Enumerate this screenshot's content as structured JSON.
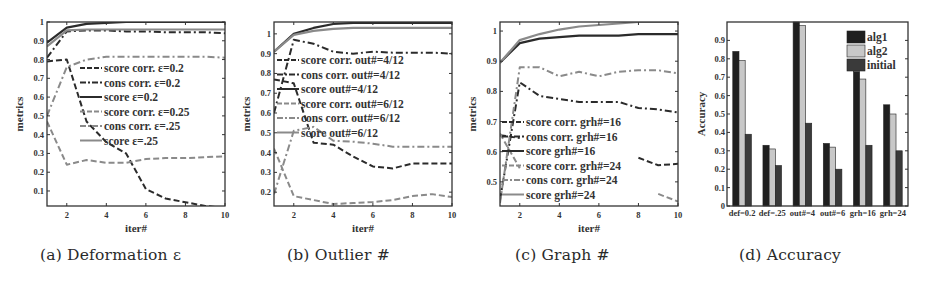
{
  "figure": {
    "captions": {
      "a": "(a)  Deformation ε",
      "b": "(b)  Outlier #",
      "c": "(c)  Graph #",
      "d": "(d)  Accuracy"
    }
  },
  "colors": {
    "line_dark": "#2b2b2b",
    "line_mid": "#555555",
    "line_light": "#8a8a8a",
    "bar_alg1": "#1f1f1f",
    "bar_alg2": "#c8c8c8",
    "bar_initial": "#3a3a3a",
    "frame": "#333333"
  },
  "chart_data": [
    {
      "id": "a",
      "type": "line",
      "title": "Deformation ε",
      "xlabel": "iter#",
      "ylabel": "metrics",
      "xlim": [
        1,
        10
      ],
      "ylim": [
        0.02,
        1.0
      ],
      "xticks": [
        2,
        4,
        6,
        8,
        10
      ],
      "yticks": [
        0.1,
        0.2,
        0.3,
        0.4,
        0.5,
        0.6,
        0.7,
        0.8,
        0.9,
        1
      ],
      "ytick_labels": [
        "0.1",
        "0.2",
        "0.3",
        "0.4",
        "0.5",
        "0.6",
        "0.7",
        "0.8",
        "0.9",
        "1"
      ],
      "legend_position": "center-right",
      "x": [
        1,
        2,
        3,
        4,
        5,
        6,
        7,
        8,
        9,
        10
      ],
      "series": [
        {
          "name": "score corr. ε=0.2",
          "style": "dashed",
          "shade": "dark",
          "values": [
            0.79,
            0.8,
            0.47,
            0.36,
            0.3,
            0.11,
            0.06,
            0.04,
            0.02,
            0.01
          ]
        },
        {
          "name": "cons corr. ε=0.2",
          "style": "dashdot",
          "shade": "dark",
          "values": [
            0.81,
            0.95,
            0.955,
            0.955,
            0.95,
            0.95,
            0.945,
            0.945,
            0.945,
            0.94
          ]
        },
        {
          "name": "score ε=0.2",
          "style": "solid",
          "shade": "dark",
          "values": [
            0.89,
            0.97,
            0.99,
            0.995,
            1.0,
            1.0,
            1.0,
            1.0,
            1.0,
            1.0
          ]
        },
        {
          "name": "score corr. ε=0.25",
          "style": "dashed",
          "shade": "light",
          "values": [
            0.47,
            0.24,
            0.265,
            0.25,
            0.25,
            0.27,
            0.275,
            0.275,
            0.28,
            0.285
          ]
        },
        {
          "name": "cons corr. ε=.25",
          "style": "dashdot",
          "shade": "light",
          "values": [
            0.5,
            0.76,
            0.8,
            0.815,
            0.815,
            0.815,
            0.815,
            0.815,
            0.815,
            0.81
          ]
        },
        {
          "name": "score ε=.25",
          "style": "solid",
          "shade": "light",
          "values": [
            0.87,
            0.955,
            0.96,
            0.96,
            0.96,
            0.96,
            0.96,
            0.96,
            0.96,
            0.96
          ]
        }
      ]
    },
    {
      "id": "b",
      "type": "line",
      "title": "Outlier #",
      "xlabel": "iter#",
      "ylabel": "metrics",
      "xlim": [
        1,
        10
      ],
      "ylim": [
        0.13,
        1.06
      ],
      "xticks": [
        2,
        4,
        6,
        8,
        10
      ],
      "yticks": [
        0.2,
        0.3,
        0.4,
        0.5,
        0.6,
        0.7,
        0.8,
        0.9,
        1
      ],
      "ytick_labels": [
        "0.2",
        "0.3",
        "0.4",
        "0.5",
        "0.6",
        "0.7",
        "0.8",
        "0.9",
        "1"
      ],
      "legend_position": "center-right",
      "x": [
        1,
        2,
        3,
        4,
        5,
        6,
        7,
        8,
        9,
        10
      ],
      "series": [
        {
          "name": "score corr. out#=4/12",
          "style": "dashed",
          "shade": "dark",
          "values": [
            0.77,
            0.75,
            0.45,
            0.44,
            0.38,
            0.33,
            0.32,
            0.345,
            0.345,
            0.345
          ]
        },
        {
          "name": "cons corr. out#=4/12",
          "style": "dashdot",
          "shade": "dark",
          "values": [
            0.6,
            0.97,
            0.95,
            0.91,
            0.9,
            0.91,
            0.905,
            0.905,
            0.905,
            0.9
          ]
        },
        {
          "name": "score out#=4/12",
          "style": "solid",
          "shade": "dark",
          "values": [
            0.91,
            1.0,
            1.03,
            1.05,
            1.055,
            1.055,
            1.055,
            1.055,
            1.055,
            1.055
          ]
        },
        {
          "name": "score corr. out#=6/12",
          "style": "dashed",
          "shade": "light",
          "values": [
            0.42,
            0.18,
            0.16,
            0.14,
            0.145,
            0.15,
            0.16,
            0.18,
            0.19,
            0.175
          ]
        },
        {
          "name": "cons corr. out#=6/12",
          "style": "dashdot",
          "shade": "light",
          "values": [
            0.19,
            0.51,
            0.53,
            0.46,
            0.455,
            0.445,
            0.43,
            0.43,
            0.43,
            0.43
          ]
        },
        {
          "name": "score out#=6/12",
          "style": "solid",
          "shade": "light",
          "values": [
            0.91,
            0.995,
            1.015,
            1.025,
            1.03,
            1.03,
            1.03,
            1.03,
            1.03,
            1.03
          ]
        }
      ]
    },
    {
      "id": "c",
      "type": "line",
      "title": "Graph #",
      "xlabel": "iter#",
      "ylabel": "metrics",
      "xlim": [
        1,
        10
      ],
      "ylim": [
        0.42,
        1.03
      ],
      "xticks": [
        2,
        4,
        6,
        8,
        10
      ],
      "yticks": [
        0.5,
        0.6,
        0.7,
        0.8,
        0.9,
        1
      ],
      "ytick_labels": [
        "0.5",
        "0.6",
        "0.7",
        "0.8",
        "0.9",
        "1"
      ],
      "legend_position": "lower-left",
      "x": [
        1,
        2,
        3,
        4,
        5,
        6,
        7,
        8,
        9,
        10
      ],
      "series": [
        {
          "name": "score corr. grh#=16",
          "style": "dashed",
          "shade": "dark",
          "values": [
            0.655,
            0.645,
            null,
            null,
            null,
            null,
            null,
            0.58,
            0.555,
            0.56
          ]
        },
        {
          "name": "cons corr. grh#=16",
          "style": "dashdot",
          "shade": "dark",
          "values": [
            0.44,
            0.83,
            0.785,
            0.775,
            0.765,
            0.765,
            0.765,
            0.745,
            0.74,
            0.73
          ]
        },
        {
          "name": "score grh#=16",
          "style": "solid",
          "shade": "dark",
          "values": [
            0.895,
            0.96,
            0.975,
            0.98,
            0.985,
            0.985,
            0.985,
            0.99,
            0.99,
            0.99
          ]
        },
        {
          "name": "score corr. grh#=24",
          "style": "dashed",
          "shade": "light",
          "values": [
            0.66,
            0.545,
            null,
            null,
            null,
            null,
            null,
            null,
            0.46,
            0.435
          ]
        },
        {
          "name": "cons corr. grh#=24",
          "style": "dashdot",
          "shade": "light",
          "values": [
            0.43,
            0.88,
            0.88,
            0.85,
            0.865,
            0.85,
            0.865,
            0.87,
            0.87,
            0.86
          ]
        },
        {
          "name": "score grh#=24",
          "style": "solid",
          "shade": "light",
          "values": [
            0.895,
            0.97,
            0.99,
            1.005,
            1.015,
            1.02,
            1.025,
            1.03,
            1.03,
            1.03
          ]
        }
      ]
    },
    {
      "id": "d",
      "type": "bar",
      "title": "Accuracy",
      "xlabel": "",
      "ylabel": "Accuracy",
      "ylim": [
        0,
        1.0
      ],
      "yticks": [
        0,
        0.1,
        0.2,
        0.3,
        0.4,
        0.5,
        0.6,
        0.7,
        0.8,
        0.9
      ],
      "ytick_labels": [
        "0",
        "0.1",
        "0.2",
        "0.3",
        "0.4",
        "0.5",
        "0.6",
        "0.7",
        "0.8",
        "0.9"
      ],
      "legend_position": "upper-right",
      "categories": [
        "def=0.2",
        "def=.25",
        "out#=4",
        "out#=6",
        "grh=16",
        "grh=24"
      ],
      "series": [
        {
          "name": "alg1",
          "values": [
            0.84,
            0.33,
            1.0,
            0.34,
            0.73,
            0.55
          ]
        },
        {
          "name": "alg2",
          "values": [
            0.79,
            0.31,
            0.98,
            0.32,
            0.69,
            0.5
          ]
        },
        {
          "name": "initial",
          "values": [
            0.39,
            0.22,
            0.45,
            0.2,
            0.33,
            0.3
          ]
        }
      ]
    }
  ]
}
